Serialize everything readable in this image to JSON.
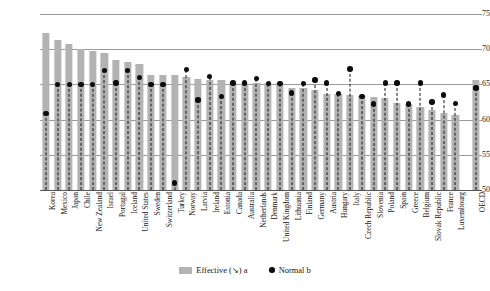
{
  "chart_data": {
    "type": "bar",
    "title": "",
    "subtitle": "",
    "xlabel": "",
    "ylabel": "",
    "ylim": [
      50,
      75
    ],
    "yticks": [
      50,
      55,
      60,
      65,
      70,
      75
    ],
    "grid": true,
    "legend_position": "bottom",
    "categories": [
      "Korea",
      "Mexico",
      "Japan",
      "Chile",
      "New Zealand",
      "Israel",
      "Portugal",
      "Iceland",
      "United States",
      "Sweden",
      "Switzerland",
      "Turkey",
      "Norway",
      "Latvia",
      "Ireland",
      "Estonia",
      "Canada",
      "Australia",
      "Netherlands",
      "Denmark",
      "United Kingdom",
      "Lithuania",
      "Finland",
      "Germany",
      "Austria",
      "Hungary",
      "Italy",
      "Czech Republic",
      "Slovenia",
      "Poland",
      "Spain",
      "Greece",
      "Belgium",
      "Slovak Republic",
      "France",
      "Luxembourg",
      "OECD"
    ],
    "series": [
      {
        "name": "Effective (↘) a",
        "type": "bar",
        "color": "#b3b3b3",
        "values": [
          72.3,
          71.3,
          70.7,
          70.0,
          69.8,
          69.4,
          68.5,
          68.2,
          67.9,
          66.4,
          66.4,
          66.3,
          66.1,
          65.8,
          65.6,
          65.6,
          65.2,
          65.2,
          65.2,
          65.2,
          65.2,
          64.5,
          64.5,
          64.2,
          63.6,
          63.6,
          63.5,
          63.3,
          63.2,
          63.0,
          62.3,
          62.2,
          61.8,
          61.3,
          61.0,
          60.7,
          65.6
        ]
      },
      {
        "name": "Normal b",
        "type": "scatter",
        "color": "#0d0d0d",
        "values": [
          60.9,
          65.0,
          65.0,
          65.0,
          65.0,
          67.0,
          65.2,
          67.0,
          66.0,
          65.0,
          65.0,
          51.0,
          67.1,
          62.8,
          66.1,
          63.3,
          65.2,
          65.2,
          65.8,
          65.1,
          65.1,
          63.8,
          65.1,
          65.6,
          65.2,
          63.7,
          67.2,
          63.3,
          62.2,
          65.2,
          65.2,
          62.2,
          65.2,
          62.5,
          63.5,
          62.3,
          64.5
        ]
      }
    ]
  },
  "legend": {
    "items": [
      {
        "label": "Effective (↘) a",
        "marker": "bar-swatch-icon"
      },
      {
        "label": "Normal b",
        "marker": "dot-marker-icon"
      }
    ]
  }
}
